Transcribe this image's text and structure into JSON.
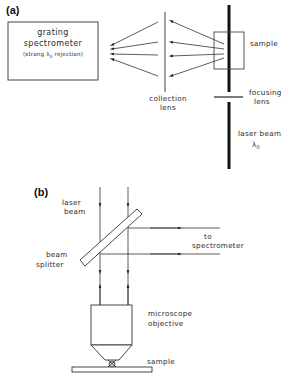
{
  "panel_a": {
    "label": "(a)",
    "spectrometer": {
      "line1": "grating",
      "line2": "spectrometer",
      "line3_prefix": "(strong ",
      "line3_lambda": "λ",
      "line3_sub": "0",
      "line3_suffix": " rejection)"
    },
    "collection_lens": {
      "line1": "collection",
      "line2": "lens"
    },
    "sample": "sample",
    "focusing_lens": {
      "line1": "focusing",
      "line2": "lens"
    },
    "laser_beam": {
      "line1": "laser beam",
      "lambda": "λ",
      "sub": "0"
    }
  },
  "panel_b": {
    "label": "(b)",
    "laser_beam": {
      "line1": "laser",
      "line2": "beam"
    },
    "to_spectrometer": {
      "line1": "to",
      "line2": "spectrometer"
    },
    "beam_splitter": {
      "line1": "beam",
      "line2": "splitter"
    },
    "objective": {
      "line1": "microscope",
      "line2": "objective"
    },
    "sample": "sample"
  },
  "colors": {
    "stroke": "#333333",
    "beam": "#111111",
    "background": "#ffffff"
  }
}
